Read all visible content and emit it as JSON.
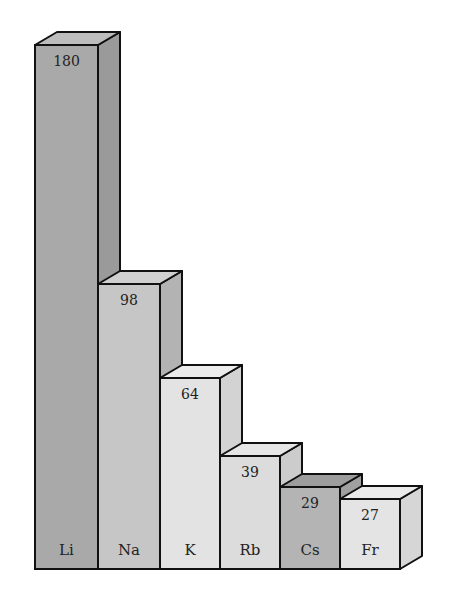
{
  "chart_data": {
    "type": "bar",
    "style": "3d-stepped-bars",
    "title": "",
    "xlabel": "",
    "ylabel": "",
    "grid": false,
    "legend": false,
    "categories": [
      "Li",
      "Na",
      "K",
      "Rb",
      "Cs",
      "Fr"
    ],
    "values": [
      180,
      98,
      64,
      39,
      29,
      27
    ],
    "colors": [
      "#a9a9a9",
      "#c6c6c6",
      "#e3e3e3",
      "#dcdcdc",
      "#b4b4b4",
      "#e4e4e4"
    ],
    "side_colors": [
      "#9a9a9a",
      "#b3b3b3",
      "#d3d3d3",
      "#cccccc",
      "#a0a0a0",
      "#d6d6d6"
    ],
    "top_colors": [
      "#bdbdbd",
      "#d0d0d0",
      "#ececec",
      "#e6e6e6",
      "#9d9d9d",
      "#ebebeb"
    ]
  },
  "bars": [
    {
      "label": "Li",
      "value": "180"
    },
    {
      "label": "Na",
      "value": "98"
    },
    {
      "label": "K",
      "value": "64"
    },
    {
      "label": "Rb",
      "value": "39"
    },
    {
      "label": "Cs",
      "value": "29"
    },
    {
      "label": "Fr",
      "value": "27"
    }
  ]
}
